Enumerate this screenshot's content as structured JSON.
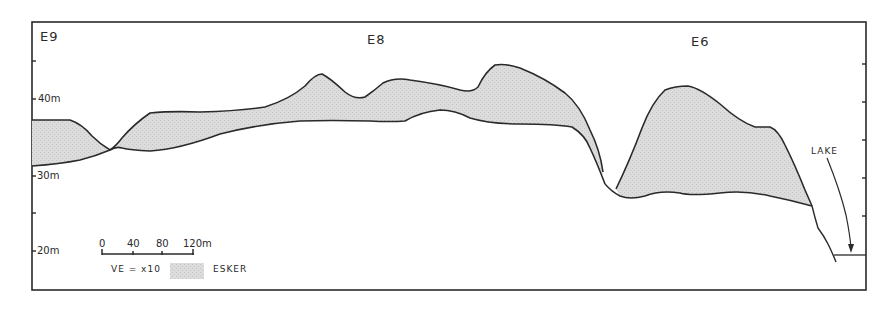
{
  "diagram": {
    "type": "topographic cross-section profile",
    "section_labels": [
      "E9",
      "E8",
      "E6"
    ],
    "y_axis": {
      "labels": [
        "40m",
        "30m",
        "20m"
      ],
      "values_m": [
        40,
        30,
        20
      ],
      "minor_ticks_m": [
        45,
        35,
        25
      ]
    },
    "scale_bar": {
      "ticks": [
        "0",
        "40",
        "80",
        "120m"
      ]
    },
    "vertical_exaggeration": "VE = x10",
    "legend": {
      "swatch_label": "ESKER",
      "swatch_color": "#d8d8d8"
    },
    "annotation": {
      "lake_label": "LAKE"
    },
    "colors": {
      "line": "#2a2a2a",
      "fill": "#d9d9d9",
      "background": "#ffffff"
    }
  }
}
